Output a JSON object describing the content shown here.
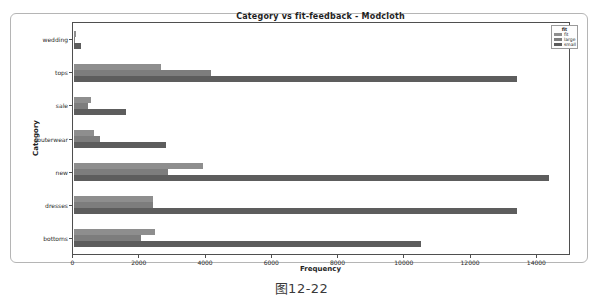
{
  "figure": {
    "title": "Category vs fit-feedback -  Modcloth",
    "xlabel": "Frequency",
    "ylabel": "Category",
    "caption": "图12-22"
  },
  "legend": {
    "title": "fit",
    "entries": [
      {
        "label": "fit",
        "color": "#8e8e8e"
      },
      {
        "label": "large",
        "color": "#7d7d7d"
      },
      {
        "label": "small",
        "color": "#5d5d5d"
      }
    ]
  },
  "chart_data": {
    "type": "bar",
    "orientation": "horizontal",
    "title": "Category vs fit-feedback -  Modcloth",
    "xlabel": "Frequency",
    "ylabel": "Category",
    "categories": [
      "wedding",
      "tops",
      "sale",
      "outerwear",
      "new",
      "dresses",
      "bottoms"
    ],
    "series": [
      {
        "name": "fit",
        "color": "#8e8e8e",
        "values": [
          70,
          2630,
          530,
          620,
          3900,
          2400,
          2450
        ]
      },
      {
        "name": "large",
        "color": "#7d7d7d",
        "values": [
          40,
          4140,
          430,
          800,
          2840,
          2400,
          2030
        ]
      },
      {
        "name": "small",
        "color": "#5d5d5d",
        "values": [
          220,
          13400,
          1580,
          2780,
          14350,
          13400,
          10500
        ]
      }
    ],
    "xlim": [
      0,
      15000
    ],
    "xticks": [
      0,
      2000,
      4000,
      6000,
      8000,
      10000,
      12000,
      14000
    ],
    "grid": false,
    "legend_title": "fit",
    "legend_position": "upper right"
  }
}
